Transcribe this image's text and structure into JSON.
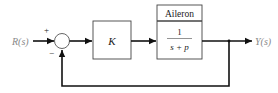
{
  "diagram": {
    "type": "feedback-control-block-diagram",
    "input_label": "R(s)",
    "output_label": "Y(s)",
    "summing_junction": {
      "plus_sign": "+",
      "minus_sign": "−"
    },
    "controller_block": {
      "label": "K"
    },
    "plant_block": {
      "title": "Aileron",
      "numerator": "1",
      "denominator": "s + p"
    },
    "feedback": "unity negative feedback"
  }
}
